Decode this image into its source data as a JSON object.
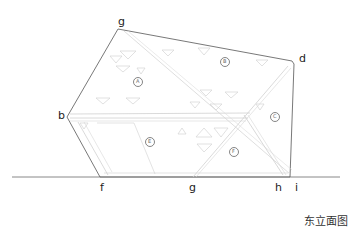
{
  "title": "东立面图",
  "vertex_labels": {
    "a": "a",
    "b": "b",
    "d": "d",
    "f": "f",
    "g": "g",
    "h": "h",
    "i": "i"
  },
  "panel_labels": {
    "A": "A",
    "B": "B",
    "C": "C",
    "E": "E",
    "F": "F"
  },
  "colors": {
    "outline": "#555555",
    "panel_line": "#cfcfcf",
    "marker": "#666666",
    "ground": "#888888"
  }
}
